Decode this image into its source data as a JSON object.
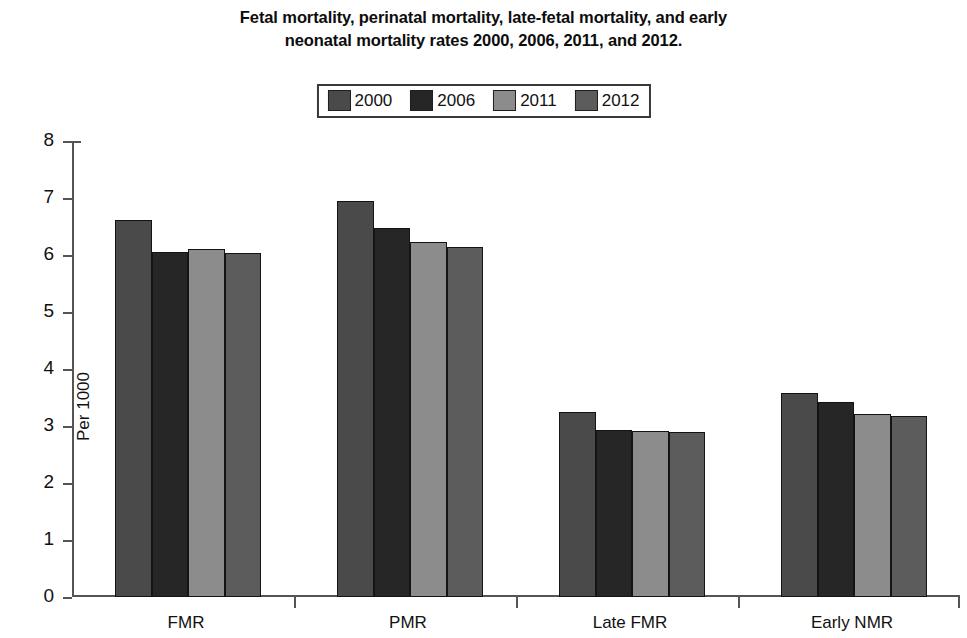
{
  "chart_data": {
    "type": "bar",
    "title": "Fetal mortality, perinatal mortality, late-fetal mortality, and early neonatal mortality rates 2000, 2006, 2011, and 2012.",
    "title_lines": [
      "Fetal mortality, perinatal mortality, late-fetal mortality, and early",
      "neonatal mortality rates 2000, 2006, 2011, and 2012."
    ],
    "xlabel": "",
    "ylabel": "Per 1000",
    "ylim": [
      0,
      8
    ],
    "ytick_step": 1,
    "yticks": [
      "8",
      "7",
      "6",
      "5",
      "4",
      "3",
      "2",
      "1",
      "0"
    ],
    "grid": false,
    "legend_position": "top-center",
    "categories": [
      "FMR",
      "PMR",
      "Late FMR",
      "Early NMR"
    ],
    "series": [
      {
        "name": "2000",
        "color": "#4a4a4a",
        "values": [
          6.62,
          6.95,
          3.25,
          3.58
        ]
      },
      {
        "name": "2006",
        "color": "#262626",
        "values": [
          6.05,
          6.48,
          2.93,
          3.43
        ]
      },
      {
        "name": "2011",
        "color": "#8c8c8c",
        "values": [
          6.1,
          6.22,
          2.92,
          3.21
        ]
      },
      {
        "name": "2012",
        "color": "#5c5c5c",
        "values": [
          6.03,
          6.14,
          2.89,
          3.17
        ]
      }
    ]
  },
  "legend": {
    "items": [
      {
        "label": "2000",
        "color": "#4a4a4a"
      },
      {
        "label": "2006",
        "color": "#262626"
      },
      {
        "label": "2011",
        "color": "#8c8c8c"
      },
      {
        "label": "2012",
        "color": "#5c5c5c"
      }
    ]
  },
  "axis": {
    "y_title": "Per 1000"
  }
}
